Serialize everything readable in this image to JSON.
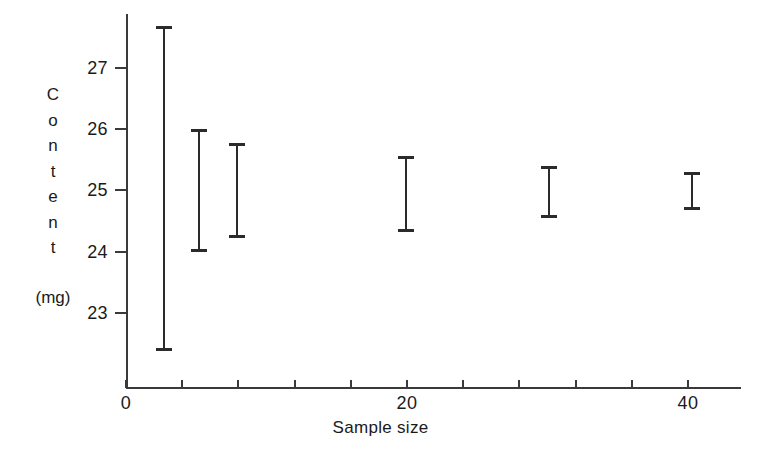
{
  "chart_data": {
    "type": "scatter",
    "title": "",
    "subtitle": "",
    "xlabel": "Sample size",
    "ylabel": "Content",
    "ylabel_units": "(mg)",
    "ylabel_letters": [
      "C",
      "o",
      "n",
      "t",
      "e",
      "n",
      "t"
    ],
    "xlim": [
      0,
      43.5
    ],
    "ylim": [
      22.2,
      27.9
    ],
    "grid": false,
    "legend": null,
    "x_ticks": [
      0,
      4,
      8,
      12,
      16,
      20,
      24,
      28,
      32,
      36,
      40
    ],
    "x_tick_labels": [
      "0",
      "",
      "",
      "",
      "",
      "20",
      "",
      "",
      "",
      "",
      "40"
    ],
    "y_ticks": [
      23,
      24,
      25,
      26,
      27
    ],
    "y_tick_labels": [
      "23",
      "24",
      "25",
      "26",
      "27"
    ],
    "series": [
      {
        "name": "Confidence interval of content",
        "marker": "error-bar",
        "color": "#2b2b2b",
        "points": [
          {
            "x": 2.7,
            "low": 22.38,
            "high": 27.69,
            "center": 25.04
          },
          {
            "x": 5.2,
            "low": 24.0,
            "high": 26.0,
            "center": 25.0
          },
          {
            "x": 7.9,
            "low": 24.23,
            "high": 25.77,
            "center": 25.0
          },
          {
            "x": 19.9,
            "low": 24.32,
            "high": 25.56,
            "center": 24.94
          },
          {
            "x": 30.1,
            "low": 24.55,
            "high": 25.4,
            "center": 24.98
          },
          {
            "x": 40.3,
            "low": 24.68,
            "high": 25.3,
            "center": 24.99
          }
        ]
      }
    ]
  },
  "axis_geometry": {
    "x0_px": 126,
    "px_per_x_unit": 14.05,
    "y_ref_value": 27,
    "y_ref_px": 68,
    "px_per_y_unit": 61.2
  }
}
